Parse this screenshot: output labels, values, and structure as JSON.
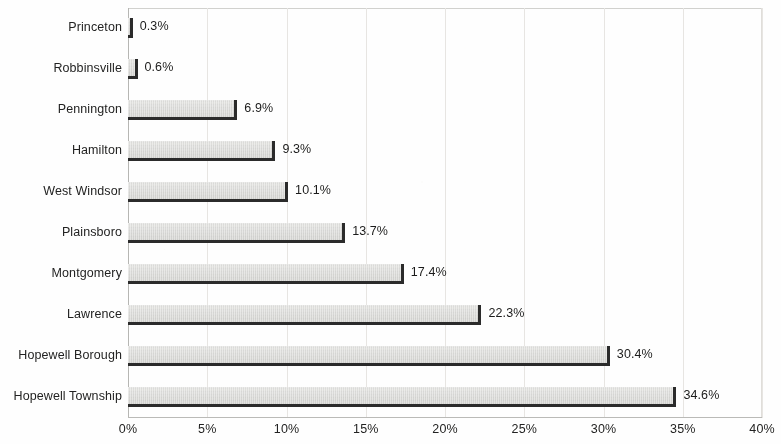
{
  "chart_data": {
    "type": "bar",
    "orientation": "horizontal",
    "title": "",
    "subtitle": "",
    "xlabel": "",
    "ylabel": "",
    "xlim": [
      0,
      40
    ],
    "xtick_labels": [
      "0%",
      "5%",
      "10%",
      "15%",
      "20%",
      "25%",
      "30%",
      "35%",
      "40%"
    ],
    "xtick_values": [
      0,
      5,
      10,
      15,
      20,
      25,
      30,
      35,
      40
    ],
    "grid": true,
    "grid_axis": "x",
    "legend": false,
    "legend_position": "none",
    "categories": [
      "Princeton",
      "Robbinsville",
      "Pennington",
      "Hamilton",
      "West Windsor",
      "Plainsboro",
      "Montgomery",
      "Lawrence",
      "Hopewell Borough",
      "Hopewell Township"
    ],
    "values": [
      0.3,
      0.6,
      6.9,
      9.3,
      10.1,
      13.7,
      17.4,
      22.3,
      30.4,
      34.6
    ],
    "value_labels": [
      "0.3%",
      "0.6%",
      "6.9%",
      "9.3%",
      "10.1%",
      "13.7%",
      "17.4%",
      "22.3%",
      "30.4%",
      "34.6%"
    ],
    "bar_fill_color": "#dcdcda",
    "bar_edge_color": "#2e2e2e",
    "plot_background_color": "#fdfdfc",
    "gridline_color": "#e4e2df",
    "text_color": "#262626"
  }
}
